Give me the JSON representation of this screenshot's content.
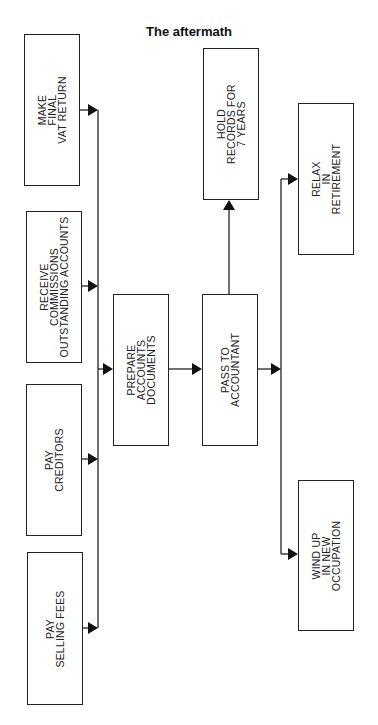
{
  "title": "The aftermath",
  "nodes": {
    "make_final_vat_return": {
      "label": "MAKE\nFINAL\nVAT RETURN"
    },
    "receive_commissions": {
      "label": "RECEIVE\nCOMMISSIONS\nOUTSTANDING ACCOUNTS"
    },
    "pay_creditors": {
      "label": "PAY\nCREDITORS"
    },
    "pay_selling_fees": {
      "label": "PAY\nSELLING FEES"
    },
    "prepare_accounts": {
      "label": "PREPARE\nACCOUNTS\nDOCUMENTS"
    },
    "pass_to_accountant": {
      "label": "PASS TO\nACCOUNTANT"
    },
    "hold_records": {
      "label": "HOLD\nRECORDS FOR\n7 YEARS"
    },
    "relax_in_retirement": {
      "label": "RELAX\nIN\nRETIREMENT"
    },
    "wind_up": {
      "label": "WIND UP\nIN NEW\nOCCUPATION"
    }
  },
  "edges": [
    {
      "from": "make_final_vat_return",
      "to": "prepare_accounts"
    },
    {
      "from": "receive_commissions",
      "to": "prepare_accounts"
    },
    {
      "from": "pay_creditors",
      "to": "prepare_accounts"
    },
    {
      "from": "pay_selling_fees",
      "to": "prepare_accounts"
    },
    {
      "from": "prepare_accounts",
      "to": "pass_to_accountant"
    },
    {
      "from": "pass_to_accountant",
      "to": "hold_records"
    },
    {
      "from": "pass_to_accountant",
      "to": "relax_in_retirement"
    },
    {
      "from": "pass_to_accountant",
      "to": "wind_up"
    }
  ]
}
